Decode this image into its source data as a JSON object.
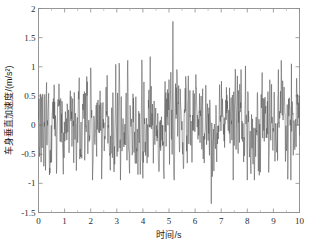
{
  "chart_data": {
    "type": "line",
    "title": "",
    "xlabel": "时间/s",
    "ylabel": "车身垂直加速度/(m/s²)",
    "xlim": [
      0,
      10
    ],
    "ylim": [
      -1.5,
      2
    ],
    "xticks": [
      0,
      1,
      2,
      3,
      4,
      5,
      6,
      7,
      8,
      9,
      10
    ],
    "xtick_labels": [
      "0",
      "1",
      "2",
      "3",
      "4",
      "5",
      "6",
      "7",
      "8",
      "9",
      "10"
    ],
    "yticks": [
      -1.5,
      -1,
      -0.5,
      0,
      0.5,
      1,
      1.5,
      2
    ],
    "ytick_labels": [
      "-1.5",
      "-1",
      "-0.5",
      "0",
      "0.5",
      "1",
      "1.5",
      "2"
    ],
    "grid": false,
    "legend": null,
    "box": true,
    "tick_direction": "in",
    "line_color": "#555555",
    "series": [
      {
        "name": "车身垂直加速度",
        "sample_interval_s": 0.01,
        "n_points": 1001,
        "stats": {
          "max": 1.78,
          "max_at_t": 5.15,
          "min": -1.35,
          "min_at_t": 6.62,
          "mean": 0.0,
          "rms": 0.42
        },
        "values": [
          0.62,
          0.1,
          -0.32,
          0.18,
          0.45,
          -0.05,
          -0.48,
          0.25,
          0.05,
          -0.55,
          0.3,
          0.58,
          -0.12,
          -0.62,
          0.22,
          0.48,
          -0.28,
          -0.78,
          0.12,
          0.52,
          -0.18,
          -1.1,
          0.35,
          0.68,
          -0.22,
          -0.45,
          0.55,
          0.15,
          -0.72,
          0.28,
          0.82,
          -0.1,
          -0.52,
          0.38,
          0.12,
          -0.62,
          0.45,
          0.72,
          -0.25,
          -0.58,
          0.32,
          0.48,
          -0.35,
          -0.42,
          0.62,
          0.18,
          -0.48,
          0.28,
          0.55,
          -0.15,
          -0.68,
          0.42,
          0.25,
          -0.55,
          0.35,
          0.78,
          -0.18,
          -0.45,
          0.22,
          0.52,
          -0.62,
          -0.28,
          0.48,
          0.15,
          -0.35,
          0.58,
          0.32,
          -0.72,
          0.18,
          0.45,
          -0.25,
          -0.55,
          0.65,
          0.12,
          -0.42,
          0.38,
          0.55,
          -0.15,
          -0.95,
          0.28,
          0.48,
          -0.32,
          -0.58,
          0.42,
          0.22,
          -0.48,
          0.35,
          0.68,
          -0.12,
          -0.52,
          0.25,
          0.45,
          -0.38,
          -0.62,
          0.55,
          0.18,
          -0.28,
          0.48,
          0.32,
          -0.75,
          0.22,
          0.58,
          -0.15,
          -0.48,
          0.38,
          0.62,
          -0.25,
          -0.55,
          0.45,
          0.15,
          -0.35,
          0.28,
          0.85,
          -0.18,
          -0.62,
          0.52,
          0.22,
          -0.45,
          0.35,
          1.05,
          -0.28,
          -0.58,
          0.42,
          0.18,
          -0.52,
          0.62,
          0.25,
          -0.38,
          0.48,
          0.75,
          -0.15,
          -0.68,
          0.32,
          0.55,
          -0.22,
          -0.45,
          0.38,
          1.22,
          0.15,
          -0.58,
          0.28,
          0.48,
          -0.35,
          -0.62,
          0.52,
          0.18,
          -0.42,
          0.65,
          0.25,
          -0.55,
          0.35,
          0.45,
          -0.28,
          -0.72,
          0.22,
          0.58,
          -0.18,
          -0.48,
          0.42,
          0.32,
          -0.62,
          0.15,
          0.55,
          -0.25,
          -1.05,
          0.38,
          0.68,
          -0.12,
          -0.45,
          0.28,
          0.52,
          -0.35,
          -0.58,
          0.62,
          0.22,
          -0.48,
          0.18,
          0.45,
          -0.28,
          -0.65,
          0.35,
          0.58,
          -0.15,
          -0.52,
          0.42,
          0.25,
          -0.38,
          0.55,
          0.32,
          -0.62,
          0.18,
          0.48,
          -0.22,
          -0.45,
          0.62,
          0.28,
          -0.55,
          0.38,
          0.72,
          -0.18
        ]
      }
    ]
  },
  "figure": {
    "background": "#ffffff",
    "axis_color": "#8c8c8c",
    "text_color": "#1a1a1a"
  }
}
